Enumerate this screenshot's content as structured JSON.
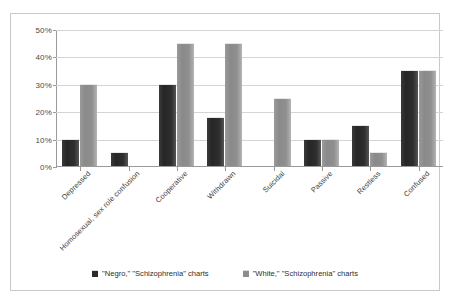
{
  "chart_data": {
    "type": "bar",
    "title": "",
    "xlabel": "",
    "ylabel": "",
    "ylim": [
      0,
      50
    ],
    "ytick_labels": [
      "0%",
      "10%",
      "20%",
      "30%",
      "40%",
      "50%"
    ],
    "ytick_values": [
      0,
      10,
      20,
      30,
      40,
      50
    ],
    "grid": true,
    "legend_position": "bottom",
    "categories": [
      "Depressed",
      "Homosexual, sex role confusion",
      "Cooperative",
      "Withdrawn",
      "Suicidal",
      "Passive",
      "Restless",
      "Confused"
    ],
    "series": [
      {
        "name": "\"Negro,\" \"Schizophrenia\" charts",
        "color": "#2b2b2b",
        "values": [
          10,
          5,
          30,
          18,
          0,
          10,
          15,
          35
        ]
      },
      {
        "name": "\"White,\" \"Schizophrenia\" charts",
        "color": "#8d8d8d",
        "values": [
          30,
          0,
          45,
          45,
          25,
          10,
          5,
          35
        ]
      }
    ]
  },
  "icons": {
    "legend_marker_dark": "dark-square-swatch",
    "legend_marker_light": "light-square-swatch"
  }
}
